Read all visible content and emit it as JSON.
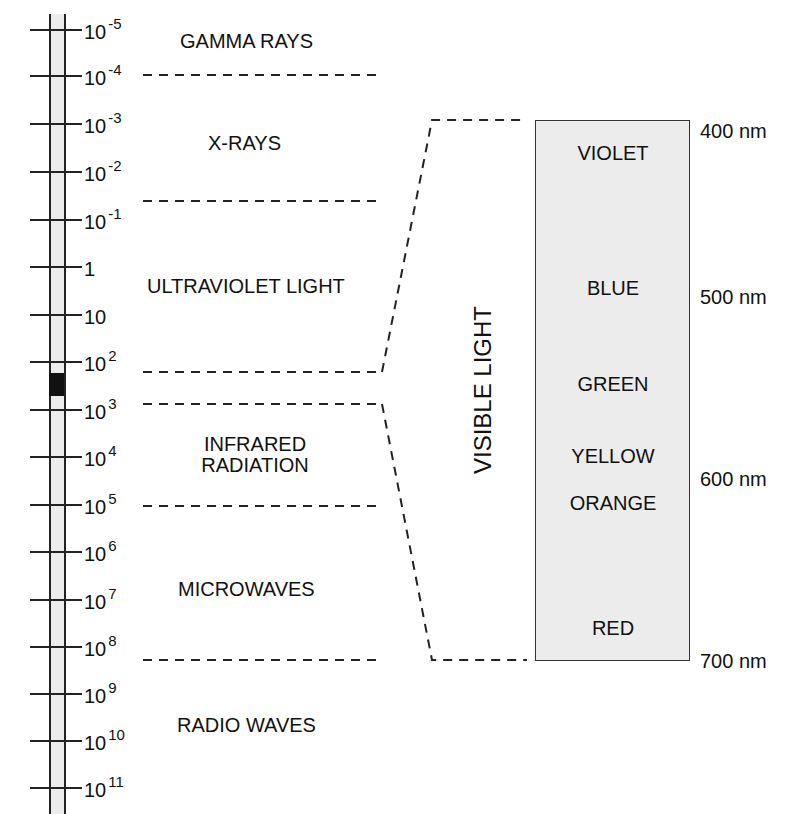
{
  "scale": {
    "ticks": [
      {
        "base": "10",
        "exp": "-5",
        "y": 30
      },
      {
        "base": "10",
        "exp": "-4",
        "y": 76
      },
      {
        "base": "10",
        "exp": "-3",
        "y": 124
      },
      {
        "base": "10",
        "exp": "-2",
        "y": 172
      },
      {
        "base": "10",
        "exp": "-1",
        "y": 220
      },
      {
        "base": "1",
        "exp": "",
        "y": 267
      },
      {
        "base": "10",
        "exp": "",
        "y": 315
      },
      {
        "base": "10",
        "exp": "2",
        "y": 362
      },
      {
        "base": "10",
        "exp": "3",
        "y": 410
      },
      {
        "base": "10",
        "exp": "4",
        "y": 457
      },
      {
        "base": "10",
        "exp": "5",
        "y": 505
      },
      {
        "base": "10",
        "exp": "6",
        "y": 552
      },
      {
        "base": "10",
        "exp": "7",
        "y": 600
      },
      {
        "base": "10",
        "exp": "8",
        "y": 647
      },
      {
        "base": "10",
        "exp": "9",
        "y": 694
      },
      {
        "base": "10",
        "exp": "10",
        "y": 741
      },
      {
        "base": "10",
        "exp": "11",
        "y": 788
      }
    ],
    "visible_marker_color": "#111111"
  },
  "bands": {
    "gamma": "GAMMA RAYS",
    "xray": "X-RAYS",
    "uv": "ULTRAVIOLET LIGHT",
    "ir_line1": "INFRARED",
    "ir_line2": "RADIATION",
    "microwave": "MICROWAVES",
    "radio": "RADIO WAVES"
  },
  "visible": {
    "title": "VISIBLE LIGHT",
    "colors": {
      "violet": "VIOLET",
      "blue": "BLUE",
      "green": "GREEN",
      "yellow": "YELLOW",
      "orange": "ORANGE",
      "red": "RED"
    },
    "wavelengths": {
      "nm400": "400 nm",
      "nm500": "500 nm",
      "nm600": "600 nm",
      "nm700": "700 nm"
    }
  }
}
